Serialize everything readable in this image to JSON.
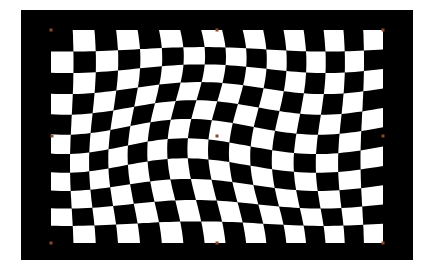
{
  "canvas": {
    "background": "#000000",
    "frame": {
      "x": 21,
      "y": 10,
      "w": 392,
      "h": 250
    }
  },
  "checkerboard": {
    "cols": 16,
    "rows": 11,
    "light_color": "#ffffff",
    "dark_color": "#000000",
    "bounds": {
      "x0": 51,
      "y0": 30,
      "x1": 383,
      "y1": 243
    },
    "warp": {
      "amp_x": 9,
      "amp_y": 8,
      "freq_x": 1.3,
      "freq_y": 1.1
    }
  },
  "warp_handles": {
    "color": "#8a4a2a",
    "size": 3,
    "points": [
      {
        "x": 51,
        "y": 30
      },
      {
        "x": 217,
        "y": 30
      },
      {
        "x": 383,
        "y": 30
      },
      {
        "x": 52,
        "y": 136
      },
      {
        "x": 217,
        "y": 136
      },
      {
        "x": 383,
        "y": 136
      },
      {
        "x": 51,
        "y": 243
      },
      {
        "x": 217,
        "y": 243
      },
      {
        "x": 383,
        "y": 243
      }
    ]
  }
}
